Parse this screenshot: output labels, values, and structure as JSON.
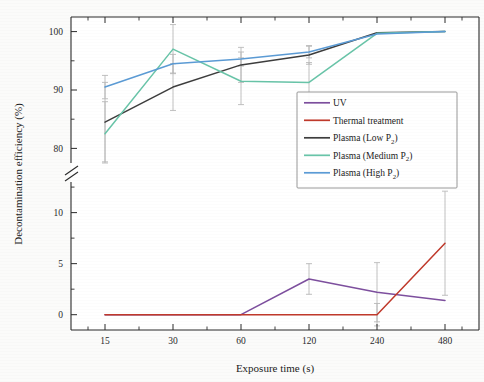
{
  "chart_data": {
    "type": "line",
    "title": "",
    "xlabel": "Exposure time (s)",
    "ylabel": "Decontamination efficiency (%)",
    "x_tick_labels": [
      "15",
      "30",
      "60",
      "120",
      "240",
      "480"
    ],
    "x_values": [
      15,
      30,
      60,
      120,
      240,
      480
    ],
    "x_scale": "categorical-log",
    "broken_axis": true,
    "axis_break_symbol": "//",
    "y_upper_ticks": [
      80,
      90,
      100
    ],
    "y_upper_tick_labels": [
      "80",
      "90",
      "100"
    ],
    "y_upper_lim": [
      77.5,
      102.5
    ],
    "y_lower_ticks": [
      0,
      5,
      10
    ],
    "y_lower_tick_labels": [
      "0",
      "5",
      "10"
    ],
    "y_lower_lim": [
      -1.5,
      13.0
    ],
    "grid": false,
    "legend_position": "upper-right-inside",
    "error_bars": true,
    "series": [
      {
        "name": "UV",
        "color": "#7d4f9e",
        "panel": "lower",
        "values": [
          0,
          0,
          0,
          3.5,
          2.2,
          1.4
        ],
        "err": [
          0,
          0,
          0,
          1.5,
          2.9,
          0
        ]
      },
      {
        "name": "Thermal treatment",
        "color": "#c0392b",
        "panel": "lower",
        "values": [
          0,
          0,
          0,
          0,
          0,
          7.0
        ],
        "err": [
          0,
          0,
          0,
          0,
          1.1,
          5.1
        ]
      },
      {
        "name": "Plasma (Low P",
        "name_sub": "2",
        "name_tail": ")",
        "color": "#3d3d3d",
        "panel": "upper",
        "values": [
          84.5,
          90.5,
          94.3,
          96.0,
          99.8,
          100.0
        ],
        "err": [
          6.8,
          4.0,
          3.0,
          1.6,
          0,
          0
        ]
      },
      {
        "name": "Plasma (Medium P",
        "name_sub": "2",
        "name_tail": ")",
        "color": "#68c4a8",
        "panel": "upper",
        "values": [
          82.5,
          97.0,
          91.5,
          91.3,
          99.7,
          100.0
        ],
        "err": [
          5.5,
          4.2,
          4.0,
          3.4,
          0,
          0
        ]
      },
      {
        "name": "Plasma (High P",
        "name_sub": "2",
        "name_tail": ")",
        "color": "#5b9bd5",
        "panel": "upper",
        "values": [
          90.5,
          94.5,
          95.3,
          96.5,
          99.6,
          100.0
        ],
        "err": [
          2.0,
          1.6,
          1.2,
          1.0,
          0,
          0
        ]
      }
    ]
  },
  "legend": {
    "entries": [
      {
        "label": "UV",
        "sub": "",
        "tail": ""
      },
      {
        "label": "Thermal treatment",
        "sub": "",
        "tail": ""
      },
      {
        "label": "Plasma (Low P",
        "sub": "2",
        "tail": ")"
      },
      {
        "label": "Plasma (Medium P",
        "sub": "2",
        "tail": ")"
      },
      {
        "label": "Plasma (High P",
        "sub": "2",
        "tail": ")"
      }
    ]
  }
}
